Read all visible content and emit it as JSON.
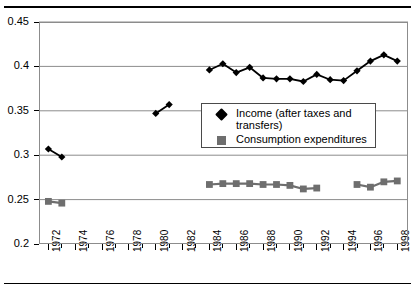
{
  "chart_data": {
    "type": "line",
    "title": "",
    "subtitle": "",
    "xlabel": "",
    "ylabel": "",
    "xlim": [
      1971.3,
      1998.8
    ],
    "ylim": [
      0.2,
      0.45
    ],
    "grid": true,
    "grid_axis": "y",
    "legend_position": "inside-center",
    "y_ticks": [
      0.2,
      0.25,
      0.3,
      0.35,
      0.4,
      0.45
    ],
    "y_tick_labels": [
      "0.2",
      "0.25",
      "0.3",
      "0.35",
      "0.4",
      "0.45"
    ],
    "x_ticks": [
      1972,
      1974,
      1976,
      1978,
      1980,
      1982,
      1984,
      1986,
      1988,
      1990,
      1992,
      1994,
      1996,
      1998
    ],
    "x_tick_labels": [
      "1972",
      "1974",
      "1976",
      "1978",
      "1980",
      "1982",
      "1984",
      "1986",
      "1988",
      "1990",
      "1992",
      "1994",
      "1996",
      "1998"
    ],
    "x_minor_ticks": [
      1973,
      1975,
      1977,
      1979,
      1981,
      1983,
      1985,
      1987,
      1989,
      1991,
      1993,
      1995,
      1997
    ],
    "series": [
      {
        "name": "Income (after taxes and transfers)",
        "color": "#000000",
        "marker": "diamond",
        "segments": [
          {
            "x": [
              1972,
              1973
            ],
            "y": [
              0.307,
              0.298
            ]
          },
          {
            "x": [
              1980,
              1981
            ],
            "y": [
              0.347,
              0.357
            ]
          },
          {
            "x": [
              1984,
              1985,
              1986,
              1987,
              1988,
              1989,
              1990,
              1991,
              1992,
              1993,
              1994,
              1995,
              1996,
              1997,
              1998
            ],
            "y": [
              0.396,
              0.403,
              0.393,
              0.399,
              0.387,
              0.386,
              0.386,
              0.383,
              0.391,
              0.385,
              0.384,
              0.395,
              0.406,
              0.413,
              0.406
            ]
          }
        ]
      },
      {
        "name": "Consumption expenditures",
        "color": "#6e6e6e",
        "marker": "square",
        "segments": [
          {
            "x": [
              1972,
              1973
            ],
            "y": [
              0.248,
              0.246
            ]
          },
          {
            "x": [
              1984,
              1985,
              1986,
              1987,
              1988,
              1989,
              1990,
              1991,
              1992
            ],
            "y": [
              0.267,
              0.268,
              0.268,
              0.268,
              0.267,
              0.267,
              0.266,
              0.262,
              0.263
            ]
          },
          {
            "x": [
              1995,
              1996,
              1997,
              1998
            ],
            "y": [
              0.267,
              0.264,
              0.27,
              0.271
            ]
          }
        ]
      }
    ]
  },
  "legend": {
    "items": [
      {
        "label": "Income (after taxes and transfers)",
        "marker": "diamond",
        "color": "#000000"
      },
      {
        "label": "Consumption expenditures",
        "marker": "square",
        "color": "#6e6e6e"
      }
    ]
  },
  "colors": {
    "income": "#000000",
    "consumption": "#6e6e6e",
    "gridline": "#8c8c8c",
    "axis": "#000000",
    "rule": "#000000"
  }
}
